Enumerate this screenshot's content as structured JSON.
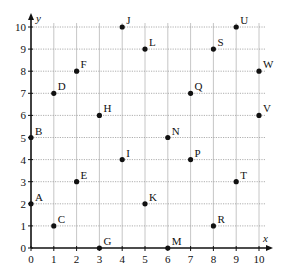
{
  "chart_data": {
    "type": "scatter",
    "title": "",
    "xlabel": "x",
    "ylabel": "y",
    "xlim": [
      0,
      10
    ],
    "ylim": [
      0,
      10
    ],
    "grid": true,
    "x_ticks": [
      "0",
      "1",
      "2",
      "3",
      "4",
      "5",
      "6",
      "7",
      "8",
      "9",
      "10"
    ],
    "y_ticks": [
      "0",
      "1",
      "2",
      "3",
      "4",
      "5",
      "6",
      "7",
      "8",
      "9",
      "10"
    ],
    "points": [
      {
        "label": "A",
        "x": 0,
        "y": 2
      },
      {
        "label": "B",
        "x": 0,
        "y": 5
      },
      {
        "label": "C",
        "x": 1,
        "y": 1
      },
      {
        "label": "D",
        "x": 1,
        "y": 7
      },
      {
        "label": "E",
        "x": 2,
        "y": 3
      },
      {
        "label": "F",
        "x": 2,
        "y": 8
      },
      {
        "label": "G",
        "x": 3,
        "y": 0
      },
      {
        "label": "H",
        "x": 3,
        "y": 6
      },
      {
        "label": "I",
        "x": 4,
        "y": 4
      },
      {
        "label": "J",
        "x": 4,
        "y": 10
      },
      {
        "label": "K",
        "x": 5,
        "y": 2
      },
      {
        "label": "L",
        "x": 5,
        "y": 9
      },
      {
        "label": "M",
        "x": 6,
        "y": 0
      },
      {
        "label": "N",
        "x": 6,
        "y": 5
      },
      {
        "label": "P",
        "x": 7,
        "y": 4
      },
      {
        "label": "Q",
        "x": 7,
        "y": 7
      },
      {
        "label": "R",
        "x": 8,
        "y": 1
      },
      {
        "label": "S",
        "x": 8,
        "y": 9
      },
      {
        "label": "T",
        "x": 9,
        "y": 3
      },
      {
        "label": "U",
        "x": 9,
        "y": 10
      },
      {
        "label": "V",
        "x": 10,
        "y": 6
      },
      {
        "label": "W",
        "x": 10,
        "y": 8
      }
    ]
  },
  "layout": {
    "origin_px": [
      31,
      248
    ],
    "unit_x_px": 22.8,
    "unit_y_px": 22.1,
    "point_color": "#111111",
    "grid_color": "#9a9a9a"
  }
}
